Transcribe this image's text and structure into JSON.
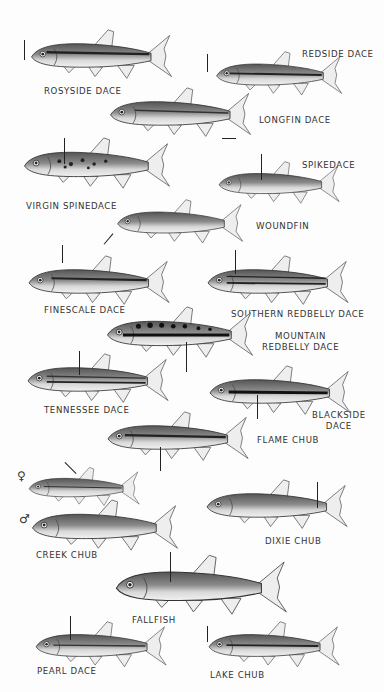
{
  "plate": {
    "background": "#fdfdfd",
    "ink": "#333333",
    "species": [
      {
        "id": "rosyside-dace",
        "label": "ROSYSIDE DACE"
      },
      {
        "id": "redside-dace",
        "label": "REDSIDE DACE"
      },
      {
        "id": "longfin-dace",
        "label": "LONGFIN DACE"
      },
      {
        "id": "virgin-spinedace",
        "label": "VIRGIN SPINEDACE"
      },
      {
        "id": "spikedace",
        "label": "SPIKEDACE"
      },
      {
        "id": "woundfin",
        "label": "WOUNDFIN"
      },
      {
        "id": "finescale-dace",
        "label": "FINESCALE DACE"
      },
      {
        "id": "southern-redbelly-dace",
        "label": "SOUTHERN REDBELLY DACE"
      },
      {
        "id": "mountain-redbelly-dace",
        "label_line1": "MOUNTAIN",
        "label_line2": "REDBELLY DACE"
      },
      {
        "id": "tennessee-dace",
        "label": "TENNESSEE DACE"
      },
      {
        "id": "blackside-dace",
        "label_line1": "BLACKSIDE",
        "label_line2": "DACE"
      },
      {
        "id": "flame-chub",
        "label": "FLAME CHUB"
      },
      {
        "id": "creek-chub",
        "label": "CREEK CHUB",
        "female_symbol": "♀",
        "male_symbol": "♂"
      },
      {
        "id": "dixie-chub",
        "label": "DIXIE CHUB"
      },
      {
        "id": "fallfish",
        "label": "FALLFISH"
      },
      {
        "id": "pearl-dace",
        "label": "PEARL DACE"
      },
      {
        "id": "lake-chub",
        "label": "LAKE CHUB"
      }
    ]
  }
}
